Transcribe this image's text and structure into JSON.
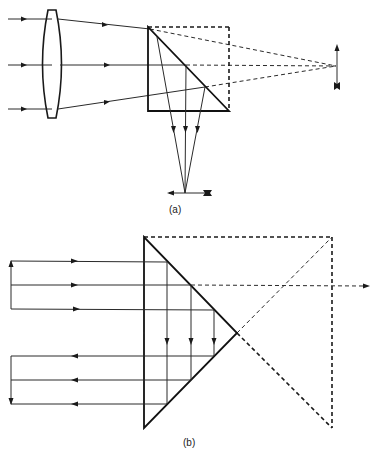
{
  "figure": {
    "panel_a": {
      "caption": "(a)",
      "description": "Converging lens with a right-angle prism folding the beam downward",
      "elements": [
        "incoming-parallel-rays",
        "convex-lens",
        "right-angle-prism",
        "dashed-unfolded-prism",
        "virtual-image-arrow",
        "real-image-arrow"
      ],
      "ray_count": 3
    },
    "panel_b": {
      "caption": "(b)",
      "description": "Right-angle (Porro) prism retro-reflecting parallel rays with inversion",
      "elements": [
        "incoming-parallel-rays",
        "outgoing-parallel-rays",
        "right-angle-prism",
        "dashed-unfolded-prism",
        "dashed-transmitted-ray"
      ],
      "ray_count_in": 3,
      "ray_count_out": 3
    },
    "colors": {
      "line": "#1a1a1a",
      "background": "#ffffff"
    }
  }
}
